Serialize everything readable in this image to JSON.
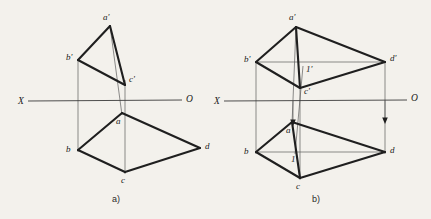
{
  "page": {
    "background_color": "#f3f1ec",
    "ink_color": "#1f1f1f",
    "thin_line_color": "#5c5c5c",
    "width": 431,
    "height": 219
  },
  "figures": [
    {
      "id": "figure-a",
      "caption": "a)",
      "caption_pos": {
        "x": 112,
        "y": 202
      },
      "axis": {
        "label_left": "X",
        "label_right": "O",
        "label_left_pos": {
          "x": 18,
          "y": 104
        },
        "label_right_pos": {
          "x": 186,
          "y": 102
        },
        "line": {
          "x1": 28,
          "y1": 101,
          "x2": 182,
          "y2": 100
        }
      },
      "points": [
        {
          "name": "a-prime",
          "label": "a'",
          "x": 110,
          "y": 26,
          "label_x": 103,
          "label_y": 20
        },
        {
          "name": "b-prime",
          "label": "b'",
          "x": 78,
          "y": 60,
          "label_x": 66,
          "label_y": 60
        },
        {
          "name": "c-prime",
          "label": "c'",
          "x": 125,
          "y": 85,
          "label_x": 129,
          "label_y": 82
        },
        {
          "name": "a",
          "label": "a",
          "x": 122,
          "y": 113,
          "label_x": 116,
          "label_y": 124
        },
        {
          "name": "b",
          "label": "b",
          "x": 78,
          "y": 150,
          "label_x": 66,
          "label_y": 152
        },
        {
          "name": "c",
          "label": "c",
          "x": 125,
          "y": 172,
          "label_x": 121,
          "label_y": 183
        },
        {
          "name": "d",
          "label": "d",
          "x": 200,
          "y": 148,
          "label_x": 205,
          "label_y": 149
        }
      ],
      "bold_edges": [
        {
          "name": "edge-aprime-bprime",
          "from": "a-prime",
          "to": "b-prime"
        },
        {
          "name": "edge-bprime-cprime",
          "from": "b-prime",
          "to": "c-prime"
        },
        {
          "name": "edge-aprime-cprime",
          "from": "a-prime",
          "to": "c-prime"
        },
        {
          "name": "edge-a-b",
          "from": "a",
          "to": "b"
        },
        {
          "name": "edge-b-c",
          "from": "b",
          "to": "c"
        },
        {
          "name": "edge-c-d",
          "from": "c",
          "to": "d"
        },
        {
          "name": "edge-d-a",
          "from": "d",
          "to": "a"
        }
      ],
      "projection_lines": [
        {
          "name": "proj-a",
          "x1": 110,
          "y1": 26,
          "x2": 122,
          "y2": 115
        },
        {
          "name": "proj-b",
          "x1": 78,
          "y1": 60,
          "x2": 78,
          "y2": 152
        },
        {
          "name": "proj-c",
          "x1": 125,
          "y1": 80,
          "x2": 125,
          "y2": 174
        }
      ]
    },
    {
      "id": "figure-b",
      "caption": "b)",
      "caption_pos": {
        "x": 312,
        "y": 202
      },
      "axis": {
        "label_left": "X",
        "label_right": "O",
        "label_left_pos": {
          "x": 214,
          "y": 104
        },
        "label_right_pos": {
          "x": 411,
          "y": 101
        },
        "line": {
          "x1": 224,
          "y1": 101,
          "x2": 407,
          "y2": 100
        }
      },
      "points": [
        {
          "name": "a-prime",
          "label": "a'",
          "x": 296,
          "y": 27,
          "label_x": 289,
          "label_y": 20
        },
        {
          "name": "b-prime",
          "label": "b'",
          "x": 256,
          "y": 62,
          "label_x": 244,
          "label_y": 62
        },
        {
          "name": "c-prime",
          "label": "c'",
          "x": 300,
          "y": 88,
          "label_x": 304,
          "label_y": 94
        },
        {
          "name": "d-prime",
          "label": "d'",
          "x": 385,
          "y": 62,
          "label_x": 390,
          "label_y": 61
        },
        {
          "name": "one-prime",
          "label": "1'",
          "x": 303,
          "y": 66,
          "label_x": 306,
          "label_y": 72
        },
        {
          "name": "a",
          "label": "a",
          "x": 292,
          "y": 122,
          "label_x": 286,
          "label_y": 133
        },
        {
          "name": "b",
          "label": "b",
          "x": 256,
          "y": 152,
          "label_x": 244,
          "label_y": 154
        },
        {
          "name": "c",
          "label": "c",
          "x": 300,
          "y": 178,
          "label_x": 296,
          "label_y": 189
        },
        {
          "name": "d",
          "label": "d",
          "x": 385,
          "y": 152,
          "label_x": 390,
          "label_y": 153
        },
        {
          "name": "one",
          "label": "1",
          "x": 295,
          "y": 152,
          "label_x": 291,
          "label_y": 162
        }
      ],
      "bold_edges": [
        {
          "name": "edge-aprime-bprime",
          "from": "a-prime",
          "to": "b-prime"
        },
        {
          "name": "edge-bprime-cprime",
          "from": "b-prime",
          "to": "c-prime"
        },
        {
          "name": "edge-cprime-dprime",
          "from": "c-prime",
          "to": "d-prime"
        },
        {
          "name": "edge-dprime-aprime",
          "from": "d-prime",
          "to": "a-prime"
        },
        {
          "name": "edge-a-b",
          "from": "a",
          "to": "b"
        },
        {
          "name": "edge-b-c",
          "from": "b",
          "to": "c"
        },
        {
          "name": "edge-c-d",
          "from": "c",
          "to": "d"
        },
        {
          "name": "edge-d-a",
          "from": "d",
          "to": "a"
        }
      ],
      "diagonals": [
        {
          "name": "diagonal-aprime-cprime",
          "x1": 296,
          "y1": 27,
          "x2": 300,
          "y2": 88
        },
        {
          "name": "diagonal-bprime-dprime",
          "x1": 256,
          "y1": 62,
          "x2": 385,
          "y2": 62
        },
        {
          "name": "diagonal-a-c",
          "x1": 292,
          "y1": 122,
          "x2": 300,
          "y2": 178
        },
        {
          "name": "diagonal-b-d",
          "x1": 256,
          "y1": 152,
          "x2": 385,
          "y2": 152
        }
      ],
      "projection_lines": [
        {
          "name": "proj-a",
          "x1": 296,
          "y1": 27,
          "x2": 292,
          "y2": 124
        },
        {
          "name": "proj-b",
          "x1": 256,
          "y1": 62,
          "x2": 256,
          "y2": 154
        },
        {
          "name": "proj-c",
          "x1": 300,
          "y1": 88,
          "x2": 300,
          "y2": 180
        },
        {
          "name": "proj-d",
          "x1": 385,
          "y1": 62,
          "x2": 385,
          "y2": 154
        },
        {
          "name": "proj-one",
          "x1": 303,
          "y1": 66,
          "x2": 295,
          "y2": 154
        }
      ],
      "arrows": [
        {
          "name": "arrow-one-down",
          "x": 293,
          "y1": 100,
          "y2": 124
        },
        {
          "name": "arrow-d-down",
          "x": 385,
          "y1": 100,
          "y2": 122
        }
      ]
    }
  ]
}
